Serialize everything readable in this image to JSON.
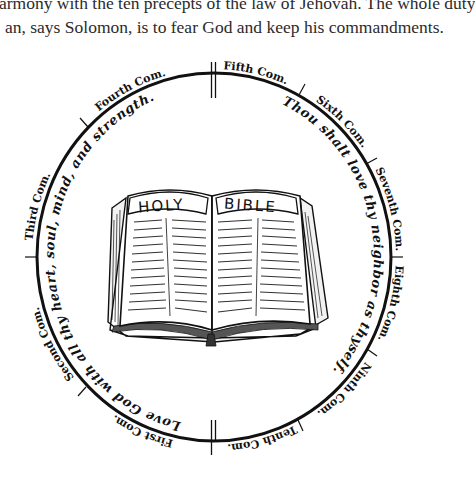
{
  "paragraph": {
    "lines": [
      "armony with the ten precepts of the law of Jehovah. The whole duty",
      "an, says Solomon, is to fear God and keep his commandments."
    ]
  },
  "diagram": {
    "commandments": [
      {
        "label": "Fifth Com."
      },
      {
        "label": "Sixth Com."
      },
      {
        "label": "Seventh Com."
      },
      {
        "label": "Eighth Com."
      },
      {
        "label": "Ninth Com."
      },
      {
        "label": "Tenth Com."
      },
      {
        "label": "First Com."
      },
      {
        "label": "Second Com."
      },
      {
        "label": "Third Com."
      },
      {
        "label": "Fourth Com."
      }
    ],
    "inner_left": "Love God with all thy heart, soul, mind, and strength.",
    "inner_right": "Thou shalt love thy neighbor as thyself.",
    "book": {
      "left_title": "HOLY",
      "right_title": "BIBLE"
    }
  }
}
